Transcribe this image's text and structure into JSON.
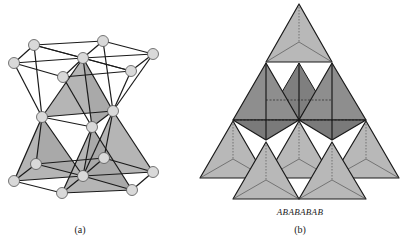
{
  "figure": {
    "panel_a": {
      "caption": "(a)",
      "description": "Ball-and-stick crystal structure with shaded tetrahedra",
      "colors": {
        "node": "#d9d9d9",
        "edge": "#1a1a1a",
        "face": "#b3b3b3"
      }
    },
    "panel_b": {
      "caption": "(b)",
      "stacking_label": "ABABABAB",
      "description": "Stacked tetrahedra arrangement",
      "colors": {
        "light_face": "#b8b8b8",
        "dark_face": "#8a8a8a",
        "edge": "#1a1a1a"
      }
    }
  }
}
